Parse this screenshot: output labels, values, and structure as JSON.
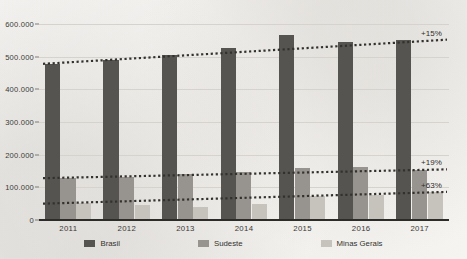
{
  "chart_data": {
    "type": "bar",
    "title": "",
    "subtitle": "",
    "xlabel": "",
    "ylabel": "",
    "categories": [
      "2011",
      "2012",
      "2013",
      "2014",
      "2015",
      "2016",
      "2017"
    ],
    "ylim": [
      0,
      600000
    ],
    "yticks": [
      0,
      100000,
      200000,
      300000,
      400000,
      500000,
      600000
    ],
    "ytick_labels": [
      "0",
      "100.000",
      "200.000",
      "300.000",
      "400.000",
      "500.000",
      "600.000"
    ],
    "grid": true,
    "legend_position": "bottom",
    "series": [
      {
        "name": "Brasil",
        "color": "#565450",
        "values": [
          478000,
          490000,
          505000,
          528000,
          565000,
          545000,
          550000
        ],
        "growth_label": "+15%"
      },
      {
        "name": "Sudeste",
        "color": "#97948f",
        "values": [
          128000,
          133000,
          140000,
          146000,
          160000,
          162000,
          152000
        ],
        "growth_label": "+19%"
      },
      {
        "name": "Minas Gerais",
        "color": "#c6c3bd",
        "values": [
          52000,
          45000,
          40000,
          50000,
          75000,
          78000,
          85000
        ],
        "growth_label": "+63%"
      }
    ],
    "annotations": [
      {
        "text": "+15%",
        "series": "Brasil"
      },
      {
        "text": "+19%",
        "series": "Sudeste"
      },
      {
        "text": "+63%",
        "series": "Minas Gerais"
      }
    ],
    "trendlines": [
      {
        "series": "Brasil",
        "style": "dotted",
        "start_value": 478000,
        "end_value": 552000
      },
      {
        "series": "Sudeste",
        "style": "dotted",
        "start_value": 128000,
        "end_value": 155000
      },
      {
        "series": "Minas Gerais",
        "style": "dotted",
        "start_value": 50000,
        "end_value": 86000
      }
    ]
  },
  "legend": {
    "items": [
      {
        "label": "Brasil"
      },
      {
        "label": "Sudeste"
      },
      {
        "label": "Minas Gerais"
      }
    ]
  }
}
